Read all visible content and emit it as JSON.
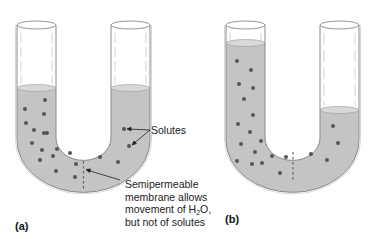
{
  "figure": {
    "panels": [
      {
        "id": "a",
        "label": "(a)",
        "left_level": "equal",
        "right_level": "equal"
      },
      {
        "id": "b",
        "label": "(b)",
        "left_level": "high",
        "right_level": "low"
      }
    ],
    "annotations": {
      "solutes": "Solutes",
      "membrane_line1": "Semipermeable",
      "membrane_line2": "membrane allows",
      "membrane_line3_pre": "movement of H",
      "membrane_line3_sub": "2",
      "membrane_line3_post": "O,",
      "membrane_line4": "but not of solutes"
    },
    "colors": {
      "liquid": "#c4c4c4",
      "tube_outline": "#8a8a8a",
      "solute": "#555555"
    }
  }
}
